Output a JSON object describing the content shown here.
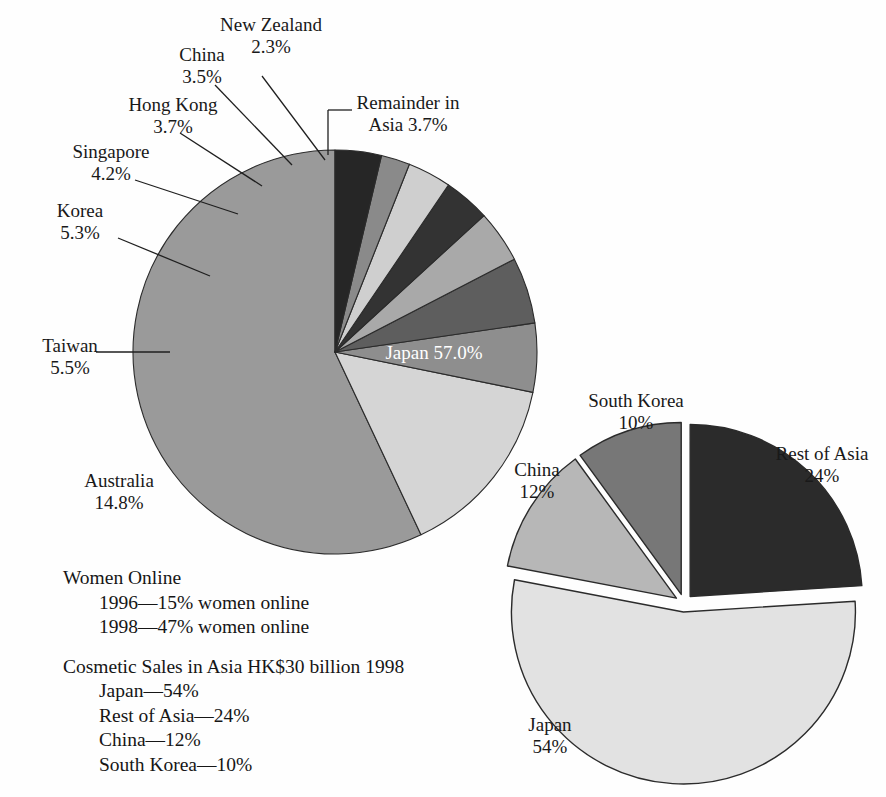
{
  "figure": {
    "background": "#fefefe",
    "outline_color": "#2b2b2b"
  },
  "chart_data": [
    {
      "id": "asia-pacific-share-pie",
      "type": "pie",
      "title": "",
      "start_angle_deg": 0,
      "direction": "counterclockwise",
      "center": [
        335,
        352
      ],
      "radius": 202,
      "exploded": false,
      "legend": "none (direct labels with leader lines)",
      "categories": [
        "Japan",
        "Australia",
        "Taiwan",
        "Korea",
        "Singapore",
        "Hong Kong",
        "China",
        "New Zealand",
        "Remainder in Asia"
      ],
      "values": [
        57.0,
        14.8,
        5.5,
        5.3,
        4.2,
        3.7,
        3.5,
        2.3,
        3.7
      ],
      "value_labels": [
        "57.0%",
        "14.8%",
        "5.5%",
        "5.3%",
        "4.2%",
        "3.7%",
        "3.5%",
        "2.3%",
        "3.7%"
      ],
      "slices": [
        {
          "name": "Japan",
          "value": 57.0,
          "label": "Japan",
          "value_label": "57.0%",
          "color": "#9a9a9a",
          "label_placement": "inside",
          "label_color": "#ffffff"
        },
        {
          "name": "Australia",
          "value": 14.8,
          "label": "Australia",
          "value_label": "14.8%",
          "color": "#d5d5d5",
          "label_placement": "outside",
          "leader": false
        },
        {
          "name": "Taiwan",
          "value": 5.5,
          "label": "Taiwan",
          "value_label": "5.5%",
          "color": "#8e8e8e",
          "label_placement": "outside",
          "leader": true
        },
        {
          "name": "Korea",
          "value": 5.3,
          "label": "Korea",
          "value_label": "5.3%",
          "color": "#5e5e5e",
          "label_placement": "outside",
          "leader": true
        },
        {
          "name": "Singapore",
          "value": 4.2,
          "label": "Singapore",
          "value_label": "4.2%",
          "color": "#a9a9a9",
          "label_placement": "outside",
          "leader": true
        },
        {
          "name": "Hong Kong",
          "value": 3.7,
          "label": "Hong Kong",
          "value_label": "3.7%",
          "color": "#333333",
          "label_placement": "outside",
          "leader": true
        },
        {
          "name": "China",
          "value": 3.5,
          "label": "China",
          "value_label": "3.5%",
          "color": "#cfcfcf",
          "label_placement": "outside",
          "leader": true
        },
        {
          "name": "New Zealand",
          "value": 2.3,
          "label": "New Zealand",
          "value_label": "2.3%",
          "color": "#8a8a8a",
          "label_placement": "outside",
          "leader": true
        },
        {
          "name": "Remainder in Asia",
          "value": 3.7,
          "label": "Remainder in Asia",
          "value_label": "3.7%",
          "color": "#262626",
          "label_placement": "outside",
          "leader": true
        }
      ]
    },
    {
      "id": "cosmetic-sales-asia-pie",
      "type": "pie",
      "title": "",
      "start_angle_deg": 0,
      "direction": "clockwise",
      "center": [
        684,
        603
      ],
      "radius": 172,
      "exploded": true,
      "legend": "none (direct labels)",
      "categories": [
        "Rest of Asia",
        "Japan",
        "China",
        "South Korea"
      ],
      "values": [
        24,
        54,
        12,
        10
      ],
      "value_labels": [
        "24%",
        "54%",
        "12%",
        "10%"
      ],
      "slices": [
        {
          "name": "Rest of Asia",
          "value": 24,
          "label": "Rest of Asia",
          "value_label": "24%",
          "color": "#2b2b2b",
          "label_placement": "outside"
        },
        {
          "name": "Japan",
          "value": 54,
          "label": "Japan",
          "value_label": "54%",
          "color": "#e2e2e2",
          "label_placement": "outside"
        },
        {
          "name": "China",
          "value": 12,
          "label": "China",
          "value_label": "12%",
          "color": "#b7b7b7",
          "label_placement": "outside"
        },
        {
          "name": "South Korea",
          "value": 10,
          "label": "South Korea",
          "value_label": "10%",
          "color": "#777777",
          "label_placement": "outside"
        }
      ]
    }
  ],
  "pie1_labels": {
    "japan": {
      "name": "Japan",
      "pct": "57.0%"
    },
    "australia": {
      "name": "Australia",
      "pct": "14.8%"
    },
    "taiwan": {
      "name": "Taiwan",
      "pct": "5.5%"
    },
    "korea": {
      "name": "Korea",
      "pct": "5.3%"
    },
    "singapore": {
      "name": "Singapore",
      "pct": "4.2%"
    },
    "hongkong": {
      "name": "Hong Kong",
      "pct": "3.7%"
    },
    "china": {
      "name": "China",
      "pct": "3.5%"
    },
    "newzealand": {
      "name": "New Zealand",
      "pct": "2.3%"
    },
    "remainder_l1": "Remainder in",
    "remainder_l2": "Asia 3.7%"
  },
  "pie2_labels": {
    "southkorea": {
      "name": "South Korea",
      "pct": "10%"
    },
    "china": {
      "name": "China",
      "pct": "12%"
    },
    "restofasia": {
      "name": "Rest of Asia",
      "pct": "24%"
    },
    "japan": {
      "name": "Japan",
      "pct": "54%"
    }
  },
  "notes": {
    "women_online_heading": "Women Online",
    "women_online_1": "1996—15% women online",
    "women_online_2": "1998—47% women online",
    "cosmetic_heading": "Cosmetic Sales in Asia HK$30 billion 1998",
    "cosmetic_1": "Japan—54%",
    "cosmetic_2": "Rest of Asia—24%",
    "cosmetic_3": "China—12%",
    "cosmetic_4": "South Korea—10%"
  }
}
